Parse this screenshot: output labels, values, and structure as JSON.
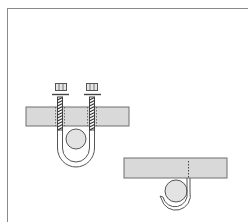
{
  "figure": {
    "colors": {
      "background": "#ffffff",
      "frame": "#8a8a8a",
      "beam_fill": "#d9d9d9",
      "beam_stroke": "#6f6f6f",
      "pipe_fill": "#e3e3e3",
      "line": "#555555"
    },
    "panels": [
      {
        "name": "u-bolt-hanger",
        "components": [
          "nut-left",
          "washer-left",
          "threaded-rod-left",
          "nut-right",
          "washer-right",
          "threaded-rod-right",
          "support-beam",
          "u-bolt",
          "pipe"
        ]
      },
      {
        "name": "strap-hanger",
        "components": [
          "support-beam",
          "fastener-dashed",
          "wrap-strap",
          "pipe"
        ]
      }
    ]
  }
}
